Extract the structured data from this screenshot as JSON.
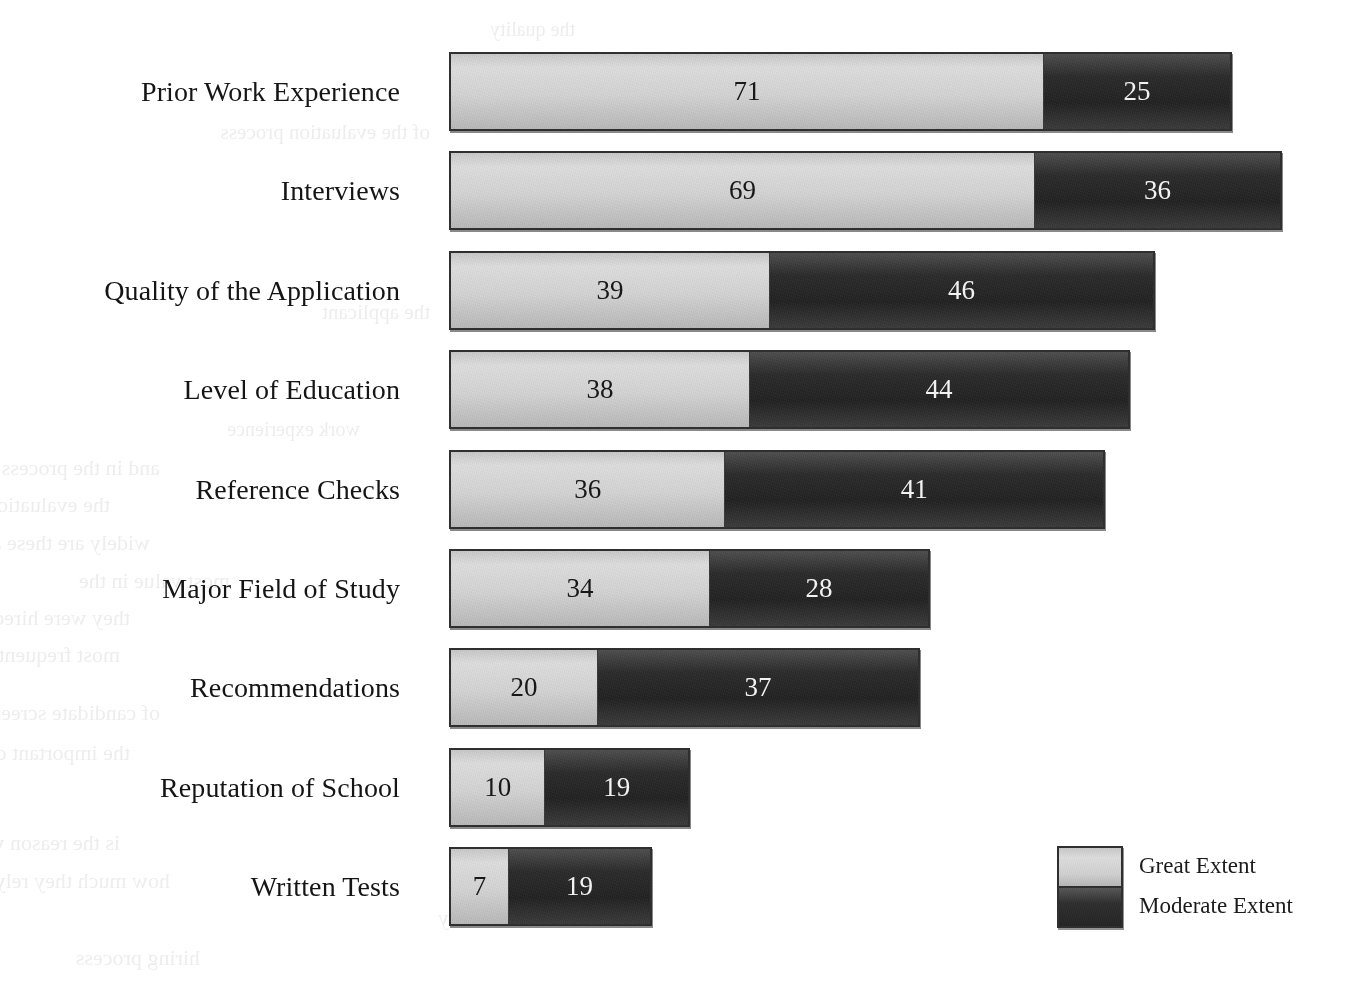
{
  "chart_data": {
    "type": "bar",
    "orientation": "horizontal",
    "stacked": true,
    "title": "",
    "xlabel": "",
    "ylabel": "",
    "grid": false,
    "legend_position": "bottom-right",
    "categories": [
      "Prior Work Experience",
      "Interviews",
      "Quality of the Application",
      "Level of Education",
      "Reference Checks",
      "Major Field of Study",
      "Recommendations",
      "Reputation of School",
      "Written Tests"
    ],
    "series": [
      {
        "name": "Great Extent",
        "color": "#d4d4d4",
        "values": [
          71,
          69,
          39,
          38,
          36,
          34,
          20,
          10,
          7
        ]
      },
      {
        "name": "Moderate Extent",
        "color": "#2b2b2b",
        "values": [
          25,
          36,
          46,
          44,
          41,
          28,
          37,
          19,
          19
        ]
      }
    ],
    "legend": [
      "Great Extent",
      "Moderate Extent"
    ]
  },
  "rows": [
    {
      "label": "Prior Work Experience",
      "top": 52,
      "height": 79,
      "left": 449,
      "light": {
        "value": "71",
        "width": 596
      },
      "dark": {
        "value": "25",
        "width": 187
      }
    },
    {
      "label": "Interviews",
      "top": 151,
      "height": 79,
      "left": 449,
      "light": {
        "value": "69",
        "width": 587
      },
      "dark": {
        "value": "36",
        "width": 246
      }
    },
    {
      "label": "Quality of the Application",
      "top": 251,
      "height": 79,
      "left": 449,
      "light": {
        "value": "39",
        "width": 321
      },
      "dark": {
        "value": "46",
        "width": 385
      }
    },
    {
      "label": "Level of Education",
      "top": 350,
      "height": 79,
      "left": 449,
      "light": {
        "value": "38",
        "width": 301
      },
      "dark": {
        "value": "44",
        "width": 380
      }
    },
    {
      "label": "Reference Checks",
      "top": 450,
      "height": 79,
      "left": 449,
      "light": {
        "value": "36",
        "width": 276
      },
      "dark": {
        "value": "41",
        "width": 380
      }
    },
    {
      "label": "Major Field of Study",
      "top": 549,
      "height": 79,
      "left": 449,
      "light": {
        "value": "34",
        "width": 261
      },
      "dark": {
        "value": "28",
        "width": 220
      }
    },
    {
      "label": "Recommendations",
      "top": 648,
      "height": 79,
      "left": 449,
      "light": {
        "value": "20",
        "width": 148
      },
      "dark": {
        "value": "37",
        "width": 323
      }
    },
    {
      "label": "Reputation of School",
      "top": 748,
      "height": 79,
      "left": 449,
      "light": {
        "value": "10",
        "width": 96
      },
      "dark": {
        "value": "19",
        "width": 145
      }
    },
    {
      "label": "Written Tests",
      "top": 847,
      "height": 79,
      "left": 449,
      "light": {
        "value": "7",
        "width": 59
      },
      "dark": {
        "value": "19",
        "width": 144
      }
    }
  ],
  "legend": {
    "items": [
      {
        "label": "Great Extent",
        "swatch": "light"
      },
      {
        "label": "Moderate Extent",
        "swatch": "dark"
      }
    ]
  },
  "background_text": [
    {
      "text": "the quality",
      "x": 575,
      "y": 18,
      "size": 20
    },
    {
      "text": "of the evaluation process",
      "x": 430,
      "y": 120,
      "size": 21
    },
    {
      "text": "tests were",
      "x": 690,
      "y": 180,
      "size": 21
    },
    {
      "text": "the applicant",
      "x": 430,
      "y": 300,
      "size": 21
    },
    {
      "text": "work experience",
      "x": 360,
      "y": 418,
      "size": 20
    },
    {
      "text": "and in the process",
      "x": 160,
      "y": 455,
      "size": 22
    },
    {
      "text": "the evaluation",
      "x": 110,
      "y": 492,
      "size": 22
    },
    {
      "text": "widely are these aspects the recommendations the agencies",
      "x": 150,
      "y": 530,
      "size": 22
    },
    {
      "text": "most value in the",
      "x": 230,
      "y": 568,
      "size": 22
    },
    {
      "text": "they were hired by",
      "x": 130,
      "y": 605,
      "size": 22
    },
    {
      "text": "most frequently reported",
      "x": 120,
      "y": 642,
      "size": 22
    },
    {
      "text": "of candidate screening",
      "x": 160,
      "y": 700,
      "size": 22
    },
    {
      "text": "the important criteria in their decisions",
      "x": 130,
      "y": 740,
      "size": 22
    },
    {
      "text": "is the reason why a smaller number is used as well as",
      "x": 120,
      "y": 830,
      "size": 22
    },
    {
      "text": "how much they rely on these measures in",
      "x": 170,
      "y": 868,
      "size": 22
    },
    {
      "text": "the security",
      "x": 540,
      "y": 905,
      "size": 22
    },
    {
      "text": "hiring process",
      "x": 200,
      "y": 945,
      "size": 22
    }
  ]
}
